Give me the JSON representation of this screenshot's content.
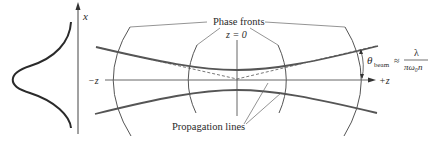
{
  "diagram": {
    "title_fragment": "",
    "profile": {
      "axis_label": "x",
      "shape": "gaussian-intensity-profile"
    },
    "labels": {
      "phase_fronts": "Phase fronts",
      "z_zero": "z = 0",
      "neg_z": "−z",
      "pos_z": "+z",
      "propagation_lines": "Propagation lines",
      "theta_symbol": "θ",
      "theta_sub": "beam",
      "approx": "≈",
      "numerator": "λ",
      "denominator": "πω₀n"
    },
    "colors": {
      "ink": "#2a2a2a",
      "beam": "#555555",
      "thin": "#666666",
      "background": "#ffffff"
    }
  }
}
